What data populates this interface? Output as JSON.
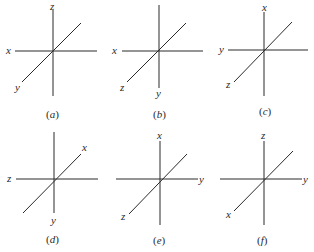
{
  "figure": {
    "stroke_color": "#2a2a2a",
    "panels": [
      {
        "id": "a",
        "caption_open": "(",
        "caption_letter": "a",
        "caption_close": ")",
        "axes": {
          "up": "z",
          "left": "x",
          "lower_left": "y"
        }
      },
      {
        "id": "b",
        "caption_open": "(",
        "caption_letter": "b",
        "caption_close": ")",
        "axes": {
          "left": "x",
          "lower_left": "z",
          "down": "y"
        }
      },
      {
        "id": "c",
        "caption_open": "(",
        "caption_letter": "c",
        "caption_close": ")",
        "axes": {
          "up": "x",
          "left": "y",
          "lower_left": "z"
        }
      },
      {
        "id": "d",
        "caption_open": "(",
        "caption_letter": "d",
        "caption_close": ")",
        "axes": {
          "upper_right": "x",
          "left": "z",
          "down": "y"
        }
      },
      {
        "id": "e",
        "caption_open": "(",
        "caption_letter": "e",
        "caption_close": ")",
        "axes": {
          "up": "x",
          "right": "y",
          "lower_left": "z"
        }
      },
      {
        "id": "f",
        "caption_open": "(",
        "caption_letter": "f",
        "caption_close": ")",
        "axes": {
          "up": "z",
          "right": "y",
          "lower_left": "x"
        }
      }
    ]
  }
}
